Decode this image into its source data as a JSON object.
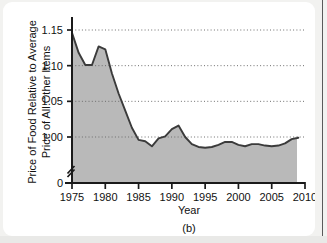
{
  "figure": {
    "caption": "(b)"
  },
  "chart_data": {
    "type": "area",
    "title": "",
    "xlabel": "Year",
    "ylabel_line1": "Price of Food Relative to Average",
    "ylabel_line2": "Price of All Other Items",
    "xlim": [
      1975,
      2010
    ],
    "ylim": [
      0.965,
      1.16
    ],
    "y_axis_break": true,
    "y_break_value": 0,
    "grid": "horizontal-dotted",
    "legend": "none",
    "fill_color": "#b9b9b9",
    "line_color": "#3b3b3b",
    "axis_color": "#1a1a1a",
    "gridline_color": "#6e6e6e",
    "xticks": [
      1975,
      1980,
      1985,
      1990,
      1995,
      2000,
      2005,
      2010
    ],
    "xtick_labels": [
      "1975",
      "1980",
      "1985",
      "1990",
      "1995",
      "2000",
      "2005",
      "2010"
    ],
    "yticks": [
      0,
      1.0,
      1.05,
      1.1,
      1.15
    ],
    "ytick_labels": [
      "0",
      "1.00",
      "1.05",
      "1.10",
      "1.15"
    ],
    "gridline_values": [
      1.0,
      1.05,
      1.1,
      1.15
    ],
    "x": [
      1975,
      1976,
      1977,
      1978,
      1979,
      1980,
      1981,
      1982,
      1983,
      1984,
      1985,
      1986,
      1987,
      1988,
      1989,
      1990,
      1991,
      1992,
      1993,
      1994,
      1995,
      1996,
      1997,
      1998,
      1999,
      2000,
      2001,
      2002,
      2003,
      2004,
      2005,
      2006,
      2007,
      2008,
      2009
    ],
    "values": [
      1.146,
      1.118,
      1.101,
      1.101,
      1.127,
      1.123,
      1.089,
      1.061,
      1.037,
      1.013,
      0.996,
      0.994,
      0.987,
      0.998,
      1.001,
      1.011,
      1.016,
      1.0,
      0.99,
      0.986,
      0.985,
      0.986,
      0.989,
      0.993,
      0.993,
      0.989,
      0.987,
      0.99,
      0.99,
      0.988,
      0.987,
      0.988,
      0.991,
      0.997,
      0.999
    ],
    "data_end_year": 2008.8,
    "series_note": "Single shaded area series; area filled gray beneath curve down to the broken zero baseline."
  }
}
